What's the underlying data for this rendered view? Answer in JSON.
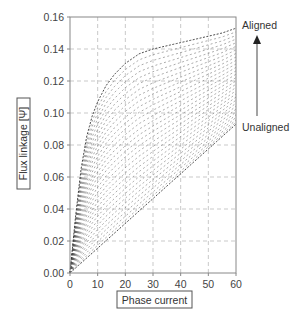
{
  "chart_data": {
    "type": "line",
    "title": "",
    "xlabel": "Phase current",
    "ylabel": "Flux linkage [Ψ]",
    "xlim": [
      0,
      60
    ],
    "ylim": [
      0,
      0.16
    ],
    "xticks": [
      0,
      10,
      20,
      30,
      40,
      50,
      60
    ],
    "yticks": [
      0.0,
      0.02,
      0.04,
      0.06,
      0.08,
      0.1,
      0.12,
      0.14,
      0.16
    ],
    "xtick_labels": [
      "0",
      "10",
      "20",
      "30",
      "40",
      "50",
      "60"
    ],
    "ytick_labels": [
      "0.00",
      "0.02",
      "0.04",
      "0.06",
      "0.08",
      "0.10",
      "0.12",
      "0.14",
      "0.16"
    ],
    "grid": true,
    "legend": null,
    "num_curves": 30,
    "annotations": {
      "top": "Aligned",
      "bottom": "Unaligned",
      "arrow": "upward arrow from Unaligned to Aligned"
    },
    "x": [
      0,
      2,
      4,
      6,
      8,
      10,
      13,
      16,
      20,
      25,
      30,
      35,
      40,
      45,
      50,
      55,
      60
    ],
    "series": [
      {
        "name": "Aligned",
        "values": [
          0,
          0.035,
          0.065,
          0.085,
          0.098,
          0.107,
          0.117,
          0.124,
          0.131,
          0.137,
          0.14,
          0.142,
          0.144,
          0.146,
          0.148,
          0.15,
          0.153
        ]
      },
      {
        "name": "Unaligned",
        "values": [
          0,
          0.0031,
          0.0062,
          0.0093,
          0.0124,
          0.0155,
          0.0202,
          0.0248,
          0.031,
          0.0388,
          0.0465,
          0.0543,
          0.062,
          0.0698,
          0.0775,
          0.0853,
          0.093
        ]
      }
    ]
  },
  "labels": {
    "xlabel": "Phase current",
    "ylabel": "Flux linkage [Ψ]",
    "aligned": "Aligned",
    "unaligned": "Unaligned"
  }
}
